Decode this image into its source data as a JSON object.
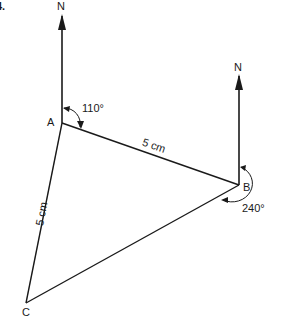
{
  "question_number": "4.",
  "points": {
    "A": {
      "label": "A",
      "x": 62,
      "y": 123
    },
    "B": {
      "label": "B",
      "x": 239,
      "y": 185
    },
    "C": {
      "label": "C",
      "x": 26,
      "y": 303
    }
  },
  "north_arrows": [
    {
      "at": "A",
      "label": "N"
    },
    {
      "at": "B",
      "label": "N"
    }
  ],
  "sides": {
    "AB": {
      "length": "5 cm"
    },
    "AC": {
      "length": "5 cm"
    },
    "BC": {
      "length": ""
    }
  },
  "bearings": {
    "A": {
      "angle": "110°",
      "description": "bearing of B from A"
    },
    "B": {
      "angle": "240°",
      "description": "bearing of C from B"
    }
  },
  "colors": {
    "ink": "#1a1a1a",
    "background": "#ffffff"
  }
}
